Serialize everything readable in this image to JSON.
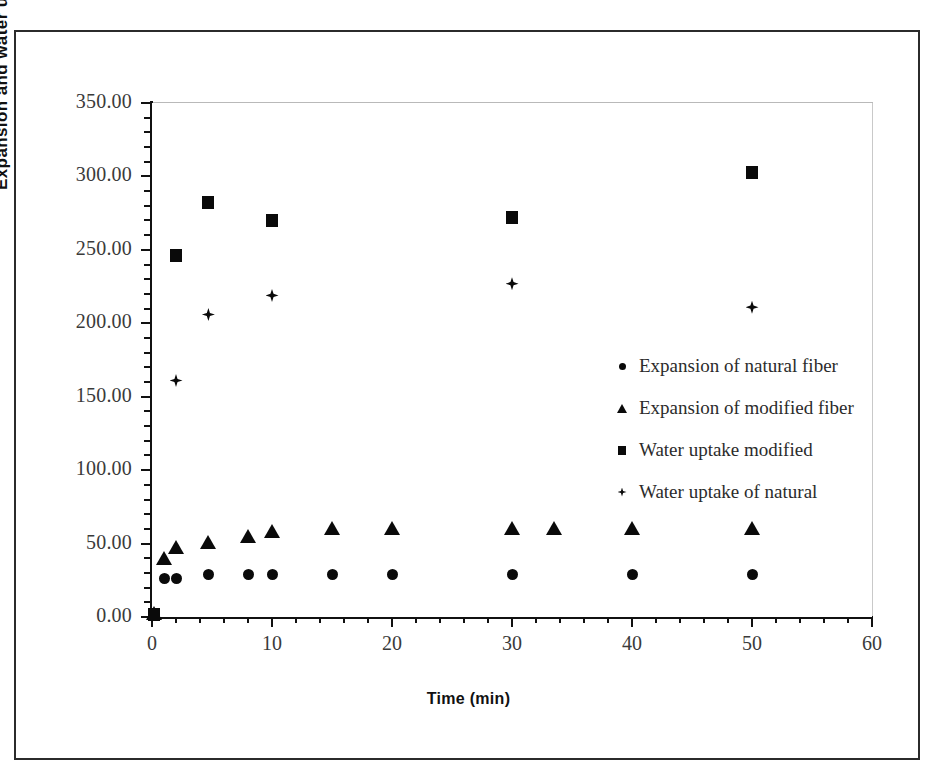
{
  "chart_data": {
    "type": "scatter",
    "title": "",
    "xlabel": "Time (min)",
    "ylabel": "Expansion and water uptake %",
    "xlim": [
      0,
      60
    ],
    "ylim": [
      0,
      350
    ],
    "grid": false,
    "legend_position": "inside-center-right",
    "x_ticks": [
      0,
      10,
      20,
      30,
      40,
      50,
      60
    ],
    "x_tick_labels": [
      "0",
      "10",
      "20",
      "30",
      "40",
      "50",
      "60"
    ],
    "x_minor_step": 2,
    "y_ticks": [
      0,
      50,
      100,
      150,
      200,
      250,
      300,
      350
    ],
    "y_tick_labels": [
      "0.00",
      "50.00",
      "100.00",
      "150.00",
      "200.00",
      "250.00",
      "300.00",
      "350.00"
    ],
    "y_minor_step": 10,
    "marker_color": "#0a0a0a",
    "series": [
      {
        "name": "Expansion of natural fiber",
        "marker": "circle",
        "points": [
          {
            "x": 0.2,
            "y": 1.0
          },
          {
            "x": 1.0,
            "y": 26.0
          },
          {
            "x": 2.0,
            "y": 26.0
          },
          {
            "x": 4.7,
            "y": 29.0
          },
          {
            "x": 8.0,
            "y": 29.0
          },
          {
            "x": 10.0,
            "y": 29.0
          },
          {
            "x": 15.0,
            "y": 29.0
          },
          {
            "x": 20.0,
            "y": 29.0
          },
          {
            "x": 30.0,
            "y": 29.0
          },
          {
            "x": 40.0,
            "y": 29.0
          },
          {
            "x": 50.0,
            "y": 29.0
          }
        ]
      },
      {
        "name": "Expansion of modified fiber",
        "marker": "triangle",
        "points": [
          {
            "x": 0.2,
            "y": 1.5
          },
          {
            "x": 1.0,
            "y": 39.0
          },
          {
            "x": 2.0,
            "y": 46.0
          },
          {
            "x": 4.7,
            "y": 50.0
          },
          {
            "x": 8.0,
            "y": 54.0
          },
          {
            "x": 10.0,
            "y": 57.0
          },
          {
            "x": 15.0,
            "y": 59.0
          },
          {
            "x": 20.0,
            "y": 59.0
          },
          {
            "x": 30.0,
            "y": 59.0
          },
          {
            "x": 33.5,
            "y": 59.0
          },
          {
            "x": 40.0,
            "y": 59.0
          },
          {
            "x": 50.0,
            "y": 59.0
          }
        ]
      },
      {
        "name": "Water uptake modified",
        "marker": "square",
        "points": [
          {
            "x": 0.2,
            "y": 1.5
          },
          {
            "x": 2.0,
            "y": 246.0
          },
          {
            "x": 4.7,
            "y": 282.0
          },
          {
            "x": 10.0,
            "y": 270.0
          },
          {
            "x": 30.0,
            "y": 272.0
          },
          {
            "x": 50.0,
            "y": 303.0
          }
        ]
      },
      {
        "name": "Water uptake of natural",
        "marker": "diamond",
        "points": [
          {
            "x": 2.0,
            "y": 161.0
          },
          {
            "x": 4.7,
            "y": 206.0
          },
          {
            "x": 10.0,
            "y": 219.0
          },
          {
            "x": 30.0,
            "y": 227.0
          },
          {
            "x": 50.0,
            "y": 211.0
          }
        ]
      }
    ]
  },
  "legend": {
    "items": [
      {
        "marker": "circle",
        "label": "Expansion of natural fiber"
      },
      {
        "marker": "triangle",
        "label": "Expansion of modified fiber"
      },
      {
        "marker": "square",
        "label": "Water uptake modified"
      },
      {
        "marker": "diamond",
        "label": "Water uptake of natural"
      }
    ]
  }
}
